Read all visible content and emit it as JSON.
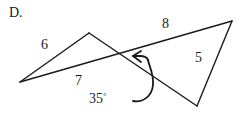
{
  "figure": {
    "part_label": "D.",
    "stroke_color": "#1a1a1a",
    "background_color": "#ffffff",
    "side_labels": {
      "upper_left": "6",
      "lower_left": "7",
      "upper_right": "8",
      "right": "5"
    },
    "angle_label": {
      "value": "35",
      "degree_symbol": "°"
    },
    "icons": {
      "rotation_arrow": "curved-arrow-icon"
    }
  }
}
